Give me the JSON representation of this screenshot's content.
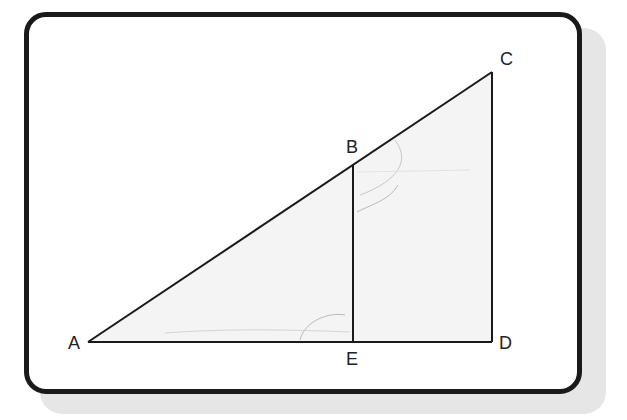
{
  "diagram": {
    "type": "similar right triangles",
    "points": {
      "A": {
        "label": "A",
        "x": 88,
        "y": 342
      },
      "B": {
        "label": "B",
        "x": 353,
        "y": 165
      },
      "C": {
        "label": "C",
        "x": 492,
        "y": 72
      },
      "D": {
        "label": "D",
        "x": 492,
        "y": 342
      },
      "E": {
        "label": "E",
        "x": 353,
        "y": 342
      }
    },
    "segments": [
      "AC",
      "AD",
      "CD",
      "BE"
    ],
    "fill_color": "#f4f4f4",
    "stroke_color": "#1a1a1a"
  }
}
